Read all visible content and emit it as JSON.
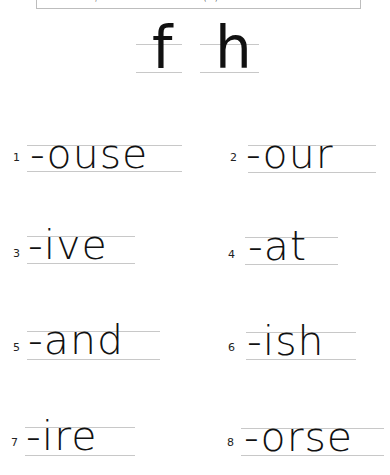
{
  "header": {
    "box_fragments": [
      ",",
      "(",
      ")"
    ]
  },
  "letters": [
    {
      "char": "f"
    },
    {
      "char": "h"
    }
  ],
  "exercises": [
    {
      "number": "1",
      "word": "-ouse"
    },
    {
      "number": "2",
      "word": "-our"
    },
    {
      "number": "3",
      "word": "-ive"
    },
    {
      "number": "4",
      "word": "-at"
    },
    {
      "number": "5",
      "word": "-and"
    },
    {
      "number": "6",
      "word": "-ish"
    },
    {
      "number": "7",
      "word": "-ire"
    },
    {
      "number": "8",
      "word": "-orse"
    }
  ],
  "colors": {
    "guide_line": "#c8c8c8",
    "text": "#111111",
    "box_border": "#bdbdbd"
  }
}
